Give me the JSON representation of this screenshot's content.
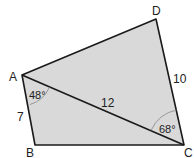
{
  "diagram": {
    "type": "quadrilateral",
    "fill_color": "#d9d9d9",
    "stroke_color": "#1a1a1a",
    "arc_color": "#888888",
    "vertices": [
      {
        "name": "A",
        "x": 22,
        "y": 75
      },
      {
        "name": "B",
        "x": 35,
        "y": 145
      },
      {
        "name": "C",
        "x": 184,
        "y": 145
      },
      {
        "name": "D",
        "x": 156,
        "y": 19
      }
    ],
    "diagonal": {
      "from": "A",
      "to": "C"
    },
    "side_labels": {
      "AB": "7",
      "AC": "12",
      "DC": "10"
    },
    "angle_labels": {
      "BAC": "48°",
      "ACD": "68°"
    },
    "vertex_labels": {
      "A": "A",
      "B": "B",
      "C": "C",
      "D": "D"
    }
  }
}
